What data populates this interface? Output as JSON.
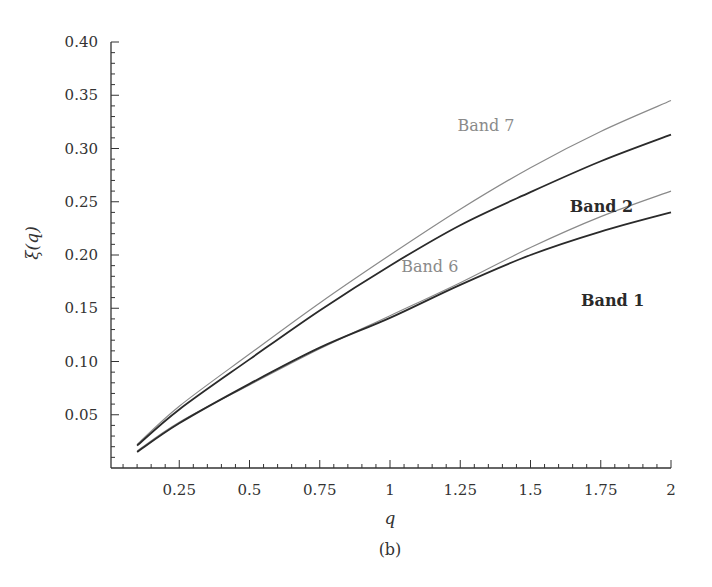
{
  "figure": {
    "caption": "(b)",
    "x_axis_title": "q",
    "y_axis_title": "ξ(q)"
  },
  "chart_data": {
    "type": "line",
    "title": "",
    "xlabel": "q",
    "ylabel": "ξ(q)",
    "xlim": [
      0,
      2
    ],
    "ylim": [
      0,
      0.4
    ],
    "grid": false,
    "legend": "inline labels near line ends",
    "x_ticks": [
      0.25,
      0.5,
      0.75,
      1,
      1.25,
      1.5,
      1.75,
      2
    ],
    "x_tick_labels": [
      "0.25",
      "0.5",
      "0.75",
      "1",
      "1.25",
      "1.5",
      "1.75",
      "2"
    ],
    "y_ticks": [
      0.05,
      0.1,
      0.15,
      0.2,
      0.25,
      0.3,
      0.35,
      0.4
    ],
    "y_tick_labels": [
      "0.05",
      "0.10",
      "0.15",
      "0.20",
      "0.25",
      "0.30",
      "0.35",
      "0.40"
    ],
    "x": [
      0.1,
      0.25,
      0.5,
      0.75,
      1.0,
      1.25,
      1.5,
      1.75,
      2.0
    ],
    "series": [
      {
        "name": "Band 7",
        "color": "#8a8a8a",
        "width": 1.2,
        "values": [
          0.022,
          0.058,
          0.107,
          0.155,
          0.2,
          0.243,
          0.282,
          0.316,
          0.345
        ],
        "label_pos": [
          0.62,
          0.79
        ]
      },
      {
        "name": "Band 1",
        "color": "#2a2a2a",
        "width": 1.8,
        "values": [
          0.021,
          0.055,
          0.102,
          0.148,
          0.19,
          0.228,
          0.259,
          0.288,
          0.313
        ],
        "label_pos": [
          0.84,
          0.38
        ]
      },
      {
        "name": "Band 6",
        "color": "#8a8a8a",
        "width": 1.2,
        "values": [
          0.016,
          0.043,
          0.078,
          0.112,
          0.143,
          0.174,
          0.207,
          0.236,
          0.26
        ],
        "label_pos": [
          0.52,
          0.46
        ]
      },
      {
        "name": "Band 2",
        "color": "#2a2a2a",
        "width": 1.8,
        "values": [
          0.015,
          0.042,
          0.079,
          0.113,
          0.141,
          0.172,
          0.2,
          0.222,
          0.24
        ],
        "label_pos": [
          0.82,
          0.6
        ]
      }
    ]
  }
}
